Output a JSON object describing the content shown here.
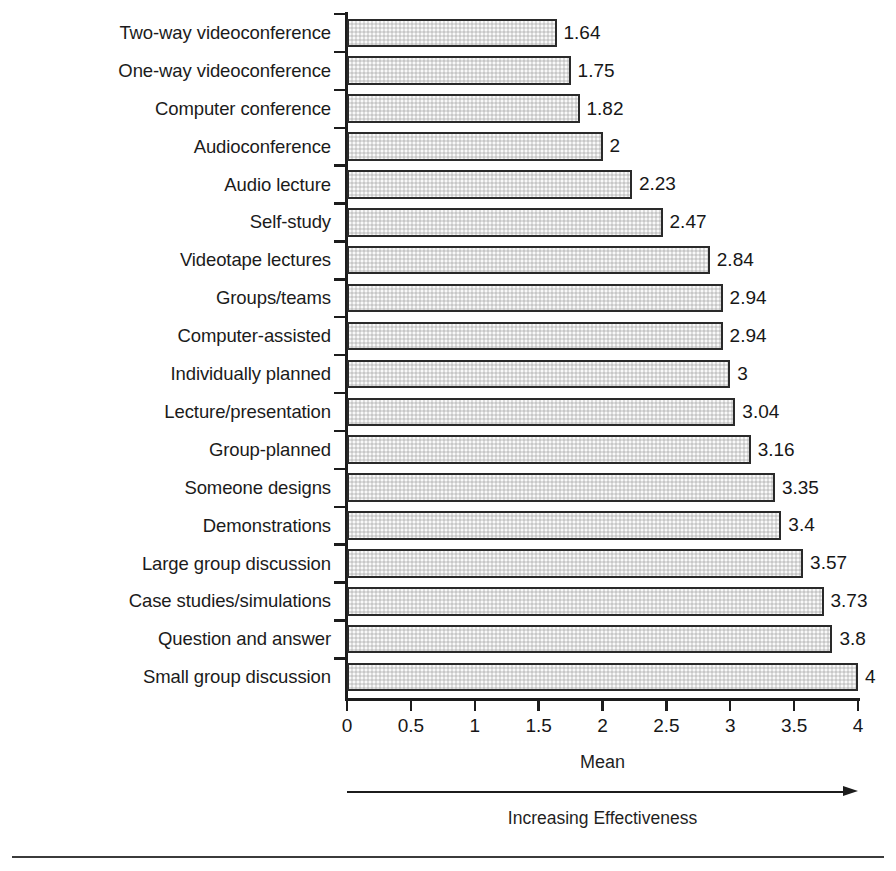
{
  "chart_data": {
    "type": "bar",
    "orientation": "horizontal",
    "title": "",
    "xlabel": "Mean",
    "ylabel": "Learning Format",
    "xlim": [
      0,
      4
    ],
    "xticks": [
      "0",
      "0.5",
      "1",
      "1.5",
      "2",
      "2.5",
      "3",
      "3.5",
      "4"
    ],
    "xtick_values": [
      0,
      0.5,
      1,
      1.5,
      2,
      2.5,
      3,
      3.5,
      4
    ],
    "grid": false,
    "legend": null,
    "annotation": "Increasing Effectiveness",
    "bar_color": "#dcdcdc",
    "bar_edge_color": "#2a2a2a",
    "categories": [
      "Two-way videoconference",
      "One-way videoconference",
      "Computer conference",
      "Audioconference",
      "Audio lecture",
      "Self-study",
      "Videotape lectures",
      "Groups/teams",
      "Computer-assisted",
      "Individually planned",
      "Lecture/presentation",
      "Group-planned",
      "Someone designs",
      "Demonstrations",
      "Large group discussion",
      "Case studies/simulations",
      "Question and answer",
      "Small group discussion"
    ],
    "values": [
      1.64,
      1.75,
      1.82,
      2,
      2.23,
      2.47,
      2.84,
      2.94,
      2.94,
      3,
      3.04,
      3.16,
      3.35,
      3.4,
      3.57,
      3.73,
      3.8,
      4
    ],
    "value_labels": [
      "1.64",
      "1.75",
      "1.82",
      "2",
      "2.23",
      "2.47",
      "2.84",
      "2.94",
      "2.94",
      "3",
      "3.04",
      "3.16",
      "3.35",
      "3.4",
      "3.57",
      "3.73",
      "3.8",
      "4"
    ]
  }
}
